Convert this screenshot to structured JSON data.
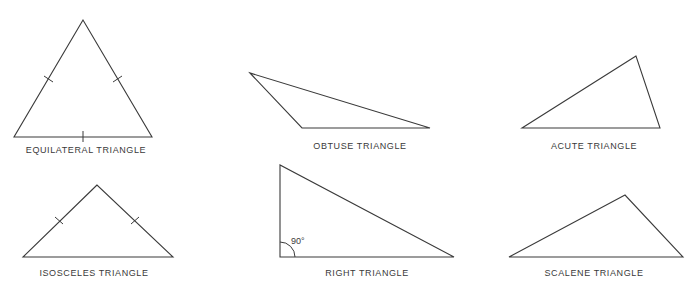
{
  "diagram": {
    "stroke_color": "#3a3a3a",
    "background": "#ffffff"
  },
  "triangles": [
    {
      "id": "equilateral",
      "label": "EQUILATERAL TRIANGLE",
      "vertices": [
        [
          83,
          20
        ],
        [
          14,
          137
        ],
        [
          152,
          137
        ]
      ],
      "tick_marks": 3,
      "label_pos": [
        86,
        150
      ]
    },
    {
      "id": "obtuse",
      "label": "OBTUSE TRIANGLE",
      "vertices": [
        [
          250,
          73
        ],
        [
          302,
          128
        ],
        [
          430,
          128
        ]
      ],
      "label_pos": [
        360,
        146
      ]
    },
    {
      "id": "acute",
      "label": "ACUTE TRIANGLE",
      "vertices": [
        [
          636,
          56
        ],
        [
          522,
          128
        ],
        [
          660,
          128
        ]
      ],
      "label_pos": [
        594,
        146
      ]
    },
    {
      "id": "isosceles",
      "label": "ISOSCELES TRIANGLE",
      "vertices": [
        [
          97,
          185
        ],
        [
          23,
          257
        ],
        [
          173,
          257
        ]
      ],
      "tick_marks": 2,
      "label_pos": [
        94,
        273
      ]
    },
    {
      "id": "right",
      "label": "RIGHT TRIANGLE",
      "vertices": [
        [
          280,
          165
        ],
        [
          280,
          257
        ],
        [
          454,
          257
        ]
      ],
      "angle_label": "90°",
      "label_pos": [
        367,
        273
      ]
    },
    {
      "id": "scalene",
      "label": "SCALENE TRIANGLE",
      "vertices": [
        [
          625,
          195
        ],
        [
          509,
          257
        ],
        [
          683,
          257
        ]
      ],
      "label_pos": [
        594,
        273
      ]
    }
  ]
}
